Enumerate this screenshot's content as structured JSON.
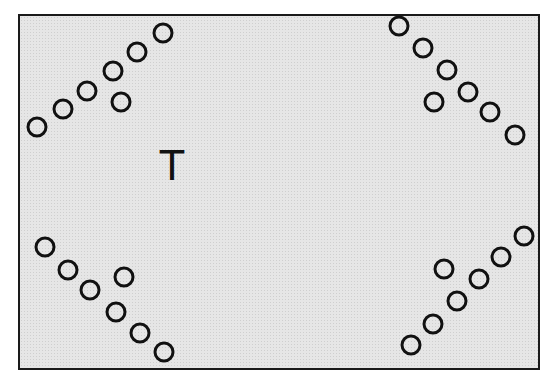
{
  "diagram": {
    "center_label": "T",
    "colors": {
      "background": "#e6e6e6",
      "stroke": "#111111"
    },
    "groups": [
      {
        "name": "top-left",
        "circles": [
          [
            37,
            127
          ],
          [
            63,
            109
          ],
          [
            87,
            91
          ],
          [
            113,
            71
          ],
          [
            137,
            52
          ],
          [
            163,
            33
          ],
          [
            121,
            102
          ]
        ]
      },
      {
        "name": "top-right",
        "circles": [
          [
            399,
            26
          ],
          [
            423,
            48
          ],
          [
            447,
            70
          ],
          [
            468,
            92
          ],
          [
            490,
            112
          ],
          [
            515,
            135
          ],
          [
            434,
            102
          ]
        ]
      },
      {
        "name": "bottom-left",
        "circles": [
          [
            45,
            247
          ],
          [
            68,
            270
          ],
          [
            90,
            290
          ],
          [
            116,
            312
          ],
          [
            140,
            333
          ],
          [
            164,
            352
          ],
          [
            124,
            277
          ]
        ]
      },
      {
        "name": "bottom-right",
        "circles": [
          [
            411,
            345
          ],
          [
            433,
            324
          ],
          [
            457,
            301
          ],
          [
            479,
            279
          ],
          [
            501,
            257
          ],
          [
            524,
            236
          ],
          [
            444,
            269
          ]
        ]
      }
    ]
  }
}
